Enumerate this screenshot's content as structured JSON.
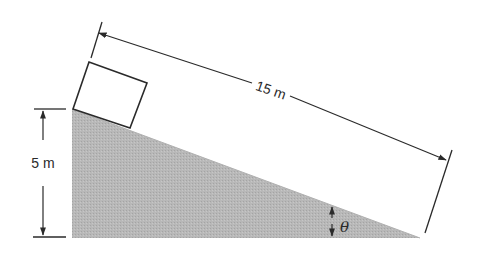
{
  "diagram": {
    "type": "inclined-plane",
    "colors": {
      "background": "#ffffff",
      "line": "#2a2a2a",
      "incline_fill": "#b4b4b4",
      "box_fill": "#ffffff"
    },
    "incline": {
      "height_label": "5 m",
      "length_label": "15 m",
      "angle_label": "θ"
    },
    "block": {
      "description": "square block at top of incline"
    }
  }
}
